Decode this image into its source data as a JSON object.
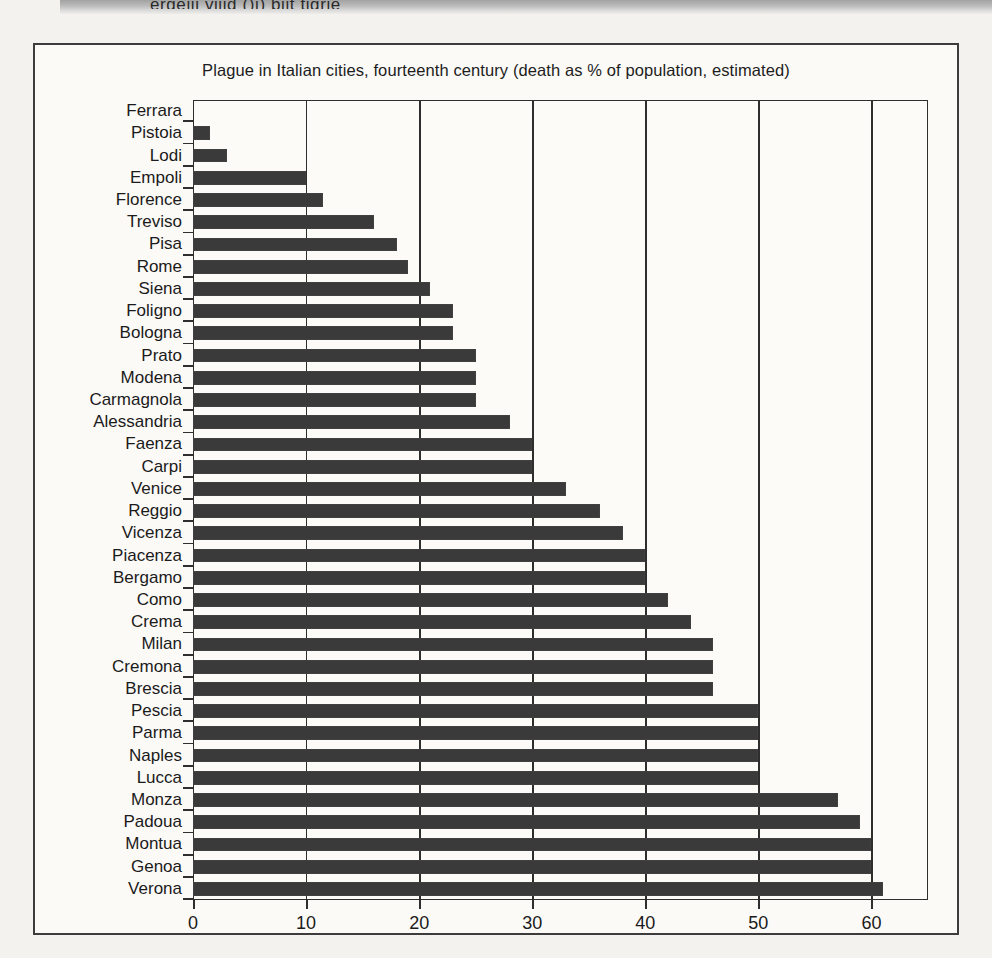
{
  "page": {
    "background_color": "#f3f2ee",
    "frame_color": "#3c3c3c",
    "top_smudge_text": "ergeiii viiid ()j) biit tigrie"
  },
  "chart_data": {
    "type": "bar",
    "orientation": "horizontal",
    "title": "Plague in Italian cities, fourteenth century (death as % of population, estimated)",
    "xlabel": "",
    "ylabel": "",
    "xlim": [
      0,
      65
    ],
    "ylim": null,
    "grid": true,
    "grid_axis": "x",
    "legend": false,
    "bar_color": "#3a3a3a",
    "xticks": [
      0,
      10,
      20,
      30,
      40,
      50,
      60
    ],
    "xtick_labels": [
      "0",
      "10",
      "20",
      "30",
      "40",
      "50",
      "60"
    ],
    "categories": [
      "Ferrara",
      "Pistoia",
      "Lodi",
      "Empoli",
      "Florence",
      "Treviso",
      "Pisa",
      "Rome",
      "Siena",
      "Foligno",
      "Bologna",
      "Prato",
      "Modena",
      "Carmagnola",
      "Alessandria",
      "Faenza",
      "Carpi",
      "Venice",
      "Reggio",
      "Vicenza",
      "Piacenza",
      "Bergamo",
      "Como",
      "Crema",
      "Milan",
      "Cremona",
      "Brescia",
      "Pescia",
      "Parma",
      "Naples",
      "Lucca",
      "Monza",
      "Padoua",
      "Montua",
      "Genoa",
      "Verona"
    ],
    "values": [
      0,
      1.5,
      3,
      10,
      11.5,
      16,
      18,
      19,
      21,
      23,
      23,
      25,
      25,
      25,
      28,
      30,
      30,
      33,
      36,
      38,
      40,
      40,
      42,
      44,
      46,
      46,
      46,
      50,
      50,
      50,
      50,
      57,
      59,
      60,
      60,
      61
    ],
    "units": "% of population"
  }
}
